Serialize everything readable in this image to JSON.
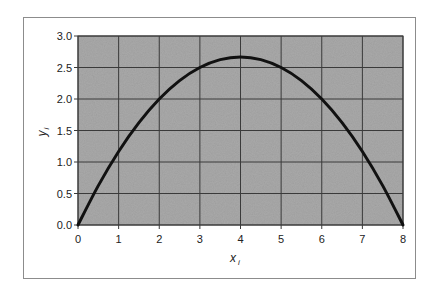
{
  "chart_data": {
    "type": "line",
    "title": "",
    "xlabel": "x_i",
    "ylabel": "y_i",
    "xlabel_main": "x",
    "xlabel_sub": "i",
    "ylabel_main": "y",
    "ylabel_sub": "i",
    "xlim": [
      0,
      8
    ],
    "ylim": [
      0,
      3.0
    ],
    "x_ticks": [
      "0",
      "1",
      "2",
      "3",
      "4",
      "5",
      "6",
      "7",
      "8"
    ],
    "y_ticks": [
      "0.0",
      "0.5",
      "1.0",
      "1.5",
      "2.0",
      "2.5",
      "3.0"
    ],
    "grid": true,
    "legend": null,
    "series": [
      {
        "name": "y_i",
        "x": [
          0,
          0.5,
          1,
          1.5,
          2,
          2.5,
          3,
          3.5,
          4,
          4.5,
          5,
          5.5,
          6,
          6.5,
          7,
          7.5,
          8
        ],
        "values": [
          0.0,
          0.625,
          1.167,
          1.625,
          2.0,
          2.292,
          2.5,
          2.625,
          2.667,
          2.625,
          2.5,
          2.292,
          2.0,
          1.625,
          1.167,
          0.625,
          0.0
        ]
      }
    ],
    "colors": {
      "plot_background": "#a9a9a9",
      "grid": "#3a3a3a",
      "line": "#111111",
      "frame": "#8c8c8c"
    }
  }
}
